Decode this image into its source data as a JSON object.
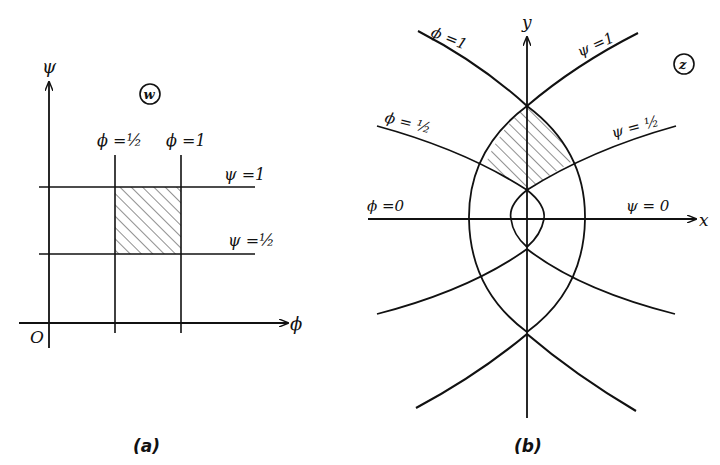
{
  "figure": {
    "panel_a": {
      "caption": "(a)",
      "plane_label": "w",
      "axis_vertical": "ψ",
      "axis_horizontal": "ϕ",
      "origin": "O",
      "vertical_lines": [
        {
          "label": "ϕ = ½",
          "value": 0.5
        },
        {
          "label": "ϕ = 1",
          "value": 1
        }
      ],
      "horizontal_lines": [
        {
          "label": "ψ = 1",
          "value": 1
        },
        {
          "label": "ψ = ½",
          "value": 0.5
        }
      ],
      "shaded_region": "½ ≤ ϕ ≤ 1, ½ ≤ ψ ≤ 1"
    },
    "panel_b": {
      "caption": "(b)",
      "plane_label": "z",
      "axis_vertical": "y",
      "axis_horizontal": "x",
      "curves": [
        {
          "label": "ϕ = 1"
        },
        {
          "label": "ψ = 1"
        },
        {
          "label": "ϕ = ½"
        },
        {
          "label": "ψ = ½"
        },
        {
          "label": "ϕ = 0"
        },
        {
          "label": "ψ = 0"
        }
      ],
      "shaded_region": "image of square in z-plane"
    }
  },
  "labels": {
    "a_phi_half": "ϕ =½",
    "a_phi_one": "ϕ =1",
    "a_psi_one": "ψ =1",
    "a_psi_half": "ψ =½",
    "b_phi_one": "ϕ =1",
    "b_psi_one": "ψ =1",
    "b_phi_half": "ϕ = ½",
    "b_psi_half": "ψ = ½",
    "b_phi_zero": "ϕ =0",
    "b_psi_zero": "ψ = 0"
  }
}
